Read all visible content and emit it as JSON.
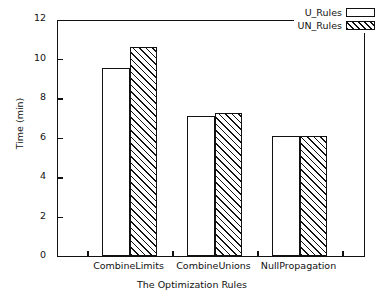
{
  "chart_data": {
    "type": "bar",
    "title": "",
    "xlabel": "The Optimization Rules",
    "ylabel": "Time (min)",
    "categories": [
      "CombineLimits",
      "CombineUnions",
      "NullPropagation"
    ],
    "series": [
      {
        "name": "U_Rules",
        "values": [
          9.5,
          7.1,
          6.1
        ],
        "fill": "solid-white",
        "color": "#ffffff"
      },
      {
        "name": "UN_Rules",
        "values": [
          10.6,
          7.25,
          6.1
        ],
        "fill": "diagonal-hatch",
        "color": "#111111"
      }
    ],
    "ylim": [
      0,
      12
    ],
    "yticks": [
      0,
      2,
      4,
      6,
      8,
      10,
      12
    ],
    "ytick_labels": [
      "0",
      "2",
      "4",
      "6",
      "8",
      "10",
      "12"
    ],
    "grid": false,
    "legend_position": "top-right",
    "axis_color": "#111111",
    "background": "#ffffff"
  },
  "legend": {
    "entries": [
      {
        "label": "U_Rules"
      },
      {
        "label": "UN_Rules"
      }
    ]
  }
}
